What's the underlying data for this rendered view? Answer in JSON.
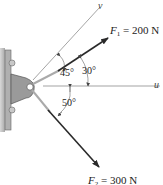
{
  "diagram": {
    "axes": {
      "u": {
        "label": "u",
        "direction_deg": 0
      },
      "v": {
        "label": "v",
        "direction_deg": 75
      }
    },
    "forces": [
      {
        "name": "F",
        "subscript": "1",
        "magnitude": "200 N",
        "direction_deg": 30,
        "equation": "= 200 N"
      },
      {
        "name": "F",
        "subscript": "2",
        "magnitude": "300 N",
        "direction_deg": -50,
        "equation": "= 300 N"
      }
    ],
    "angles": [
      {
        "label": "45°",
        "between": "v and F2 side above u? (v to horizontal reference)"
      },
      {
        "label": "30°",
        "between": "F1 and u"
      },
      {
        "label": "50°",
        "between": "u and F2"
      }
    ],
    "colors": {
      "line": "#555555",
      "arrow": "#2a2a2a",
      "bracket": "#9a9a9a",
      "wall": "#bdbdbd"
    }
  }
}
